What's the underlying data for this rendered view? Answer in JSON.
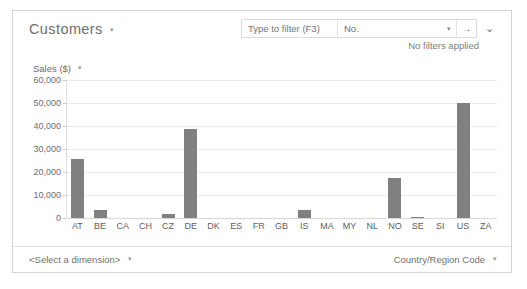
{
  "panel": {
    "title": "Customers",
    "title_caret": "▾"
  },
  "filter": {
    "quick_placeholder": "Type to filter (F3)",
    "field_value": "No.",
    "field_caret": "▾",
    "go_icon": "→",
    "expand_icon": "⌄",
    "status": "No filters applied"
  },
  "footer": {
    "dimension_label": "<Select a dimension>",
    "dimension_caret": "▾",
    "measure_label": "Country/Region Code",
    "measure_caret": "▾"
  },
  "chart_data": {
    "type": "bar",
    "title": "",
    "xlabel": "",
    "ylabel": "Sales ($)",
    "ylabel_caret": "▾",
    "ylim": [
      0,
      60000
    ],
    "yticks": [
      "60,000",
      "50,000",
      "40,000",
      "30,000",
      "20,000",
      "10,000",
      "0"
    ],
    "ytick_values": [
      60000,
      50000,
      40000,
      30000,
      20000,
      10000,
      0
    ],
    "grid": true,
    "legend": "none",
    "categories": [
      "AT",
      "BE",
      "CA",
      "CH",
      "CZ",
      "DE",
      "DK",
      "ES",
      "FR",
      "GB",
      "IS",
      "MA",
      "MY",
      "NL",
      "NO",
      "SE",
      "SI",
      "US",
      "ZA"
    ],
    "values": [
      25500,
      3500,
      0,
      0,
      1900,
      38500,
      0,
      0,
      0,
      0,
      3700,
      0,
      0,
      0,
      17500,
      600,
      0,
      50000,
      0
    ],
    "bar_color": "#808080"
  }
}
